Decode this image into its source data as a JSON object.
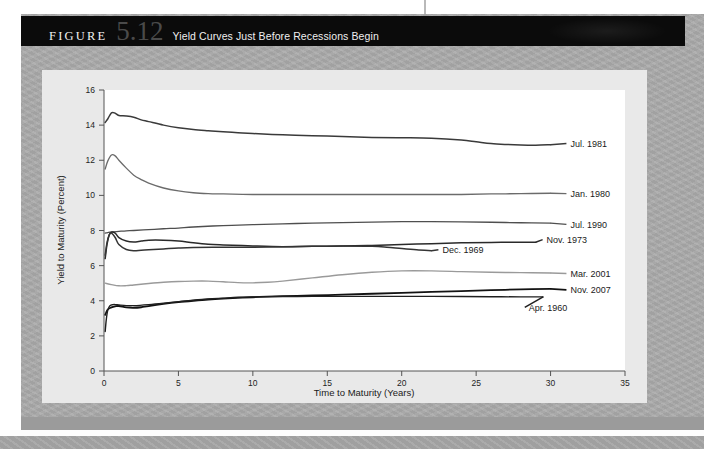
{
  "figure": {
    "label": "FIGURE",
    "number": "5.12",
    "title": "Yield Curves Just Before Recessions Begin"
  },
  "colors": {
    "page_background": "#a9a9a9",
    "panel_background": "#e9e9e9",
    "plot_background": "#ffffff",
    "title_bar": "#0b0b0b",
    "title_text": "#efefef",
    "figure_number": "#4a4a4a",
    "axis": "#555555",
    "dark_curve": "#1a1a1a",
    "mid_curve": "#4a4a4a",
    "light_curve": "#8c8c8c"
  },
  "chart_data": {
    "type": "line",
    "title": "Yield Curves Just Before Recessions Begin",
    "xlabel": "Time to Maturity (Years)",
    "ylabel": "Yield to Maturity (Percent)",
    "xlim": [
      0,
      35
    ],
    "ylim": [
      0,
      16
    ],
    "xticks": [
      0,
      5,
      10,
      15,
      20,
      25,
      30,
      35
    ],
    "yticks": [
      0,
      2,
      4,
      6,
      8,
      10,
      12,
      14,
      16
    ],
    "grid": false,
    "legend": "inline-right-labels",
    "series": [
      {
        "name": "Jul. 1981",
        "color": "#3a3a3a",
        "width": 1.5,
        "label_x": 31.2,
        "label_y": 12.95,
        "x": [
          0.08,
          0.25,
          0.5,
          0.75,
          1,
          1.5,
          2,
          2.5,
          3,
          4,
          5,
          6,
          7,
          8,
          9,
          10,
          12,
          14,
          16,
          18,
          20,
          22,
          24,
          25,
          26,
          27,
          28,
          29,
          30
        ],
        "y": [
          14.15,
          14.35,
          14.7,
          14.68,
          14.55,
          14.52,
          14.45,
          14.3,
          14.2,
          14.0,
          13.85,
          13.75,
          13.68,
          13.62,
          13.57,
          13.52,
          13.45,
          13.4,
          13.35,
          13.3,
          13.28,
          13.25,
          13.15,
          13.05,
          12.95,
          12.9,
          12.87,
          12.86,
          12.88
        ]
      },
      {
        "name": "Jan. 1980",
        "color": "#6b6b6b",
        "width": 1.3,
        "label_x": 31.2,
        "label_y": 10.1,
        "x": [
          0.08,
          0.25,
          0.5,
          0.75,
          1,
          1.5,
          2,
          2.5,
          3,
          4,
          5,
          6,
          7,
          8,
          10,
          12,
          14,
          16,
          18,
          20,
          22,
          24,
          26,
          28,
          30
        ],
        "y": [
          11.5,
          11.95,
          12.3,
          12.25,
          12.0,
          11.55,
          11.15,
          10.9,
          10.7,
          10.42,
          10.25,
          10.15,
          10.1,
          10.08,
          10.05,
          10.05,
          10.05,
          10.05,
          10.05,
          10.05,
          10.05,
          10.05,
          10.08,
          10.1,
          10.12
        ]
      },
      {
        "name": "Jul. 1990",
        "color": "#4f4f4f",
        "width": 1.3,
        "label_x": 31.2,
        "label_y": 8.35,
        "x": [
          0.08,
          0.25,
          0.5,
          1,
          1.5,
          2,
          3,
          4,
          5,
          6,
          8,
          10,
          12,
          14,
          16,
          18,
          20,
          22,
          24,
          26,
          28,
          30
        ],
        "y": [
          7.85,
          7.88,
          7.92,
          7.95,
          7.98,
          8.0,
          8.05,
          8.1,
          8.14,
          8.2,
          8.28,
          8.33,
          8.38,
          8.42,
          8.45,
          8.48,
          8.5,
          8.5,
          8.49,
          8.47,
          8.44,
          8.42
        ]
      },
      {
        "name": "Nov. 1973",
        "color": "#2a2a2a",
        "width": 1.5,
        "label_x": 29.6,
        "label_y": 7.48,
        "x": [
          0.08,
          0.2,
          0.35,
          0.5,
          0.75,
          1,
          1.5,
          2,
          2.5,
          3,
          4,
          5,
          6,
          7,
          8,
          10,
          12,
          14,
          16,
          18,
          20,
          22,
          24,
          26,
          28,
          29
        ],
        "y": [
          6.4,
          7.2,
          7.75,
          7.9,
          7.85,
          7.6,
          7.4,
          7.35,
          7.4,
          7.45,
          7.45,
          7.4,
          7.3,
          7.22,
          7.18,
          7.12,
          7.08,
          7.1,
          7.12,
          7.15,
          7.2,
          7.25,
          7.3,
          7.32,
          7.33,
          7.33
        ]
      },
      {
        "name": "Dec. 1969",
        "color": "#343434",
        "width": 1.5,
        "label_x": 22.6,
        "label_y": 6.9,
        "x": [
          0.08,
          0.2,
          0.35,
          0.5,
          0.75,
          1,
          1.5,
          2,
          2.5,
          3,
          4,
          5,
          6,
          8,
          10,
          12,
          14,
          16,
          18,
          19,
          20,
          21,
          22
        ],
        "y": [
          6.6,
          7.3,
          7.75,
          7.85,
          7.6,
          7.2,
          6.92,
          6.85,
          6.88,
          6.9,
          6.95,
          7.0,
          7.03,
          7.05,
          7.05,
          7.07,
          7.1,
          7.12,
          7.1,
          7.05,
          6.97,
          6.9,
          6.85
        ]
      },
      {
        "name": "Mar. 2001",
        "color": "#9a9a9a",
        "width": 1.4,
        "label_x": 31.2,
        "label_y": 5.55,
        "x": [
          0.08,
          0.5,
          1,
          1.5,
          2,
          3,
          4,
          5,
          6,
          7,
          8,
          9,
          10,
          11,
          12,
          14,
          16,
          18,
          20,
          22,
          24,
          26,
          28,
          30
        ],
        "y": [
          5.0,
          4.92,
          4.85,
          4.86,
          4.9,
          4.98,
          5.05,
          5.1,
          5.12,
          5.12,
          5.08,
          5.03,
          5.02,
          5.05,
          5.12,
          5.3,
          5.48,
          5.62,
          5.7,
          5.7,
          5.66,
          5.62,
          5.6,
          5.58
        ]
      },
      {
        "name": "Nov. 2007",
        "color": "#121212",
        "width": 1.8,
        "label_x": 31.2,
        "label_y": 4.62,
        "x": [
          0.08,
          0.25,
          0.5,
          0.75,
          1,
          1.5,
          2,
          2.5,
          3,
          4,
          5,
          6,
          7,
          8,
          10,
          12,
          14,
          16,
          18,
          20,
          22,
          24,
          26,
          28,
          30
        ],
        "y": [
          3.2,
          3.5,
          3.62,
          3.68,
          3.7,
          3.62,
          3.6,
          3.63,
          3.7,
          3.82,
          3.92,
          4.0,
          4.07,
          4.12,
          4.2,
          4.26,
          4.3,
          4.35,
          4.4,
          4.45,
          4.5,
          4.55,
          4.6,
          4.65,
          4.68
        ]
      },
      {
        "name": "Apr. 1960",
        "color": "#1f1f1f",
        "width": 1.4,
        "label_x": 28.4,
        "label_y": 3.62,
        "x": [
          0.08,
          0.15,
          0.25,
          0.4,
          0.6,
          0.8,
          1,
          1.5,
          2,
          3,
          4,
          5,
          6,
          7,
          8,
          9,
          10,
          12,
          14,
          16,
          18,
          20,
          22,
          24,
          26,
          28,
          29.5
        ],
        "y": [
          2.25,
          2.9,
          3.45,
          3.72,
          3.78,
          3.78,
          3.76,
          3.72,
          3.72,
          3.78,
          3.86,
          3.95,
          4.03,
          4.1,
          4.15,
          4.2,
          4.22,
          4.24,
          4.25,
          4.25,
          4.25,
          4.25,
          4.25,
          4.24,
          4.23,
          4.22,
          4.22
        ]
      }
    ]
  }
}
